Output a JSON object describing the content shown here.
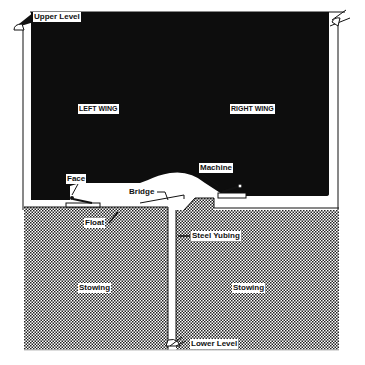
{
  "diagram": {
    "type": "mining-cross-section",
    "colors": {
      "void": "#0d0d0d",
      "stowing": "#9a9a9a",
      "background": "#ffffff",
      "line": "#111111"
    },
    "labels": {
      "upper_level": "Upper Level",
      "left_wing": "LEFT WING",
      "right_wing": "RIGHT WING",
      "face": "Face",
      "machine": "Machine",
      "bridge": "Bridge",
      "float": "Float",
      "steel_tubing": "Steel Yubing",
      "stowing_left": "Stowing",
      "stowing_right": "Stowing",
      "lower_level": "Lower Level"
    }
  }
}
